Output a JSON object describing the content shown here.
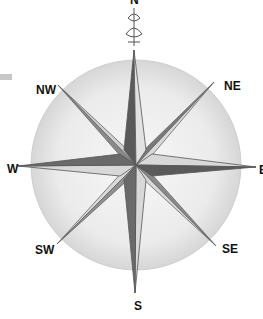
{
  "image": {
    "subject": "compass-rose",
    "style": "pencil drawing",
    "colors": {
      "background": "#ffffff",
      "circle_fill": "#e6e6e6",
      "dark_face": "#5a5a5a",
      "light_face": "#d8d8d8",
      "outline": "#666666",
      "label": "#111111"
    }
  },
  "compass": {
    "center": [
      136,
      165
    ],
    "radius": 105,
    "labels": [
      {
        "text": "N",
        "x": 130,
        "y": -6
      },
      {
        "text": "NE",
        "x": 224,
        "y": 80
      },
      {
        "text": "E",
        "x": 259,
        "y": 164
      },
      {
        "text": "SE",
        "x": 222,
        "y": 243
      },
      {
        "text": "S",
        "x": 134,
        "y": 300
      },
      {
        "text": "SW",
        "x": 35,
        "y": 244
      },
      {
        "text": "W",
        "x": 7,
        "y": 163
      },
      {
        "text": "NW",
        "x": 36,
        "y": 84
      }
    ]
  }
}
